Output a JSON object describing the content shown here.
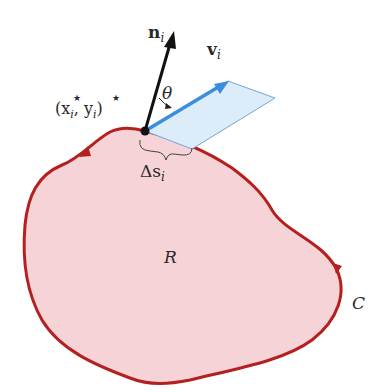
{
  "diagram": {
    "colors": {
      "region_fill": "#f6d3d6",
      "boundary_stroke": "#b4201f",
      "normal_vector": "#111111",
      "velocity_vector": "#3a8ee0",
      "parallelogram_fill": "#dcecf8",
      "parallelogram_stroke": "#6fa8dc",
      "text": "#2a2a2a"
    },
    "labels": {
      "normal": "n",
      "normal_sub": "i",
      "velocity": "v",
      "velocity_sub": "i",
      "angle": "θ",
      "point_open": "(x",
      "point_sub1": "i",
      "point_comma": ", y",
      "point_sub2": "i",
      "point_close": ")",
      "star": "★",
      "arc_length_delta": "Δs",
      "arc_length_sub": "i",
      "region": "R",
      "curve": "C"
    },
    "elements": [
      "region R",
      "boundary curve C (counterclockwise orientation arrows)",
      "point (x_i*, y_i*)",
      "unit normal vector n_i",
      "vector v_i",
      "angle θ between n_i and v_i",
      "parallelogram spanned by v_i over Δs_i",
      "arc length Δs_i brace"
    ]
  }
}
